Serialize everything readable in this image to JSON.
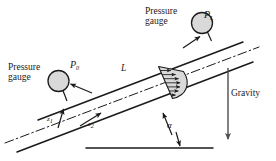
{
  "figure": {
    "type": "physics-diagram",
    "background_color": "#ffffff",
    "line_color": "#1a1a1a",
    "fill_color": "#d9d9d9"
  },
  "labels": {
    "pressure_gauge_right_line1": "Pressure",
    "pressure_gauge_right_line2": "gauge",
    "pressure_gauge_left_line1": "Pressure",
    "pressure_gauge_left_line2": "gauge",
    "pressure_downstream": "P",
    "pressure_downstream_sub": "L",
    "pressure_upstream": "P",
    "pressure_upstream_sub": "0",
    "length": "L",
    "elevation_1": "z",
    "elevation_1_sub": "1",
    "elevation_2": "z",
    "elevation_2_sub": "2",
    "angle": "α",
    "gravity": "Gravity"
  },
  "elements": {
    "pipe_walls": 2,
    "centerline_style": "dash-dot",
    "velocity_profile": "parabolic",
    "velocity_arrows": 7,
    "gauges": 2,
    "gravity_direction": "down",
    "horizontal_reference_line": true
  }
}
